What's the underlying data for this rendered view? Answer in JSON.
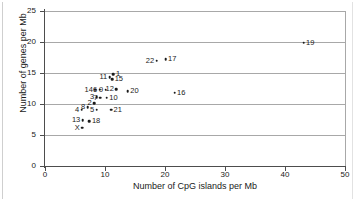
{
  "chart_data": {
    "type": "scatter",
    "title": "",
    "xlabel": "Number of CpG islands per Mb",
    "ylabel": "Number of genes per Mb",
    "xlim": [
      0,
      50
    ],
    "ylim": [
      0,
      25
    ],
    "xticks": [
      0,
      10,
      20,
      30,
      40,
      50
    ],
    "yticks": [
      0,
      5,
      10,
      15,
      20,
      25
    ],
    "grid": "horizontal",
    "legend": "none",
    "point_label_field": "chromosome",
    "points": [
      {
        "label": "1",
        "x": 11.4,
        "y": 14.8,
        "label_pos": "right"
      },
      {
        "label": "2",
        "x": 8.2,
        "y": 10.1,
        "label_pos": "left"
      },
      {
        "label": "3",
        "x": 8.6,
        "y": 11.1,
        "label_pos": "left"
      },
      {
        "label": "4",
        "x": 6.1,
        "y": 9.1,
        "label_pos": "left"
      },
      {
        "label": "5",
        "x": 8.6,
        "y": 9.1,
        "label_pos": "left"
      },
      {
        "label": "6",
        "x": 9.1,
        "y": 12.3,
        "label_pos": "left"
      },
      {
        "label": "7",
        "x": 9.2,
        "y": 11.0,
        "label_pos": "left"
      },
      {
        "label": "8",
        "x": 7.1,
        "y": 9.5,
        "label_pos": "left"
      },
      {
        "label": "9",
        "x": 10.1,
        "y": 12.3,
        "label_pos": "left"
      },
      {
        "label": "10",
        "x": 10.3,
        "y": 11.0,
        "label_pos": "right"
      },
      {
        "label": "11",
        "x": 10.8,
        "y": 14.3,
        "label_pos": "left"
      },
      {
        "label": "12",
        "x": 11.9,
        "y": 12.4,
        "label_pos": "left"
      },
      {
        "label": "13",
        "x": 6.3,
        "y": 7.4,
        "label_pos": "left"
      },
      {
        "label": "14",
        "x": 8.4,
        "y": 12.3,
        "label_pos": "left"
      },
      {
        "label": "15",
        "x": 11.2,
        "y": 14.0,
        "label_pos": "right"
      },
      {
        "label": "16",
        "x": 21.6,
        "y": 11.8,
        "label_pos": "right"
      },
      {
        "label": "17",
        "x": 20.1,
        "y": 17.2,
        "label_pos": "right"
      },
      {
        "label": "18",
        "x": 7.4,
        "y": 7.2,
        "label_pos": "right"
      },
      {
        "label": "19",
        "x": 43.1,
        "y": 19.9,
        "label_pos": "right"
      },
      {
        "label": "20",
        "x": 13.8,
        "y": 12.1,
        "label_pos": "right"
      },
      {
        "label": "21",
        "x": 11.0,
        "y": 9.1,
        "label_pos": "right"
      },
      {
        "label": "22",
        "x": 18.6,
        "y": 17.0,
        "label_pos": "left"
      },
      {
        "label": "X",
        "x": 6.2,
        "y": 6.2,
        "label_pos": "left"
      }
    ]
  }
}
